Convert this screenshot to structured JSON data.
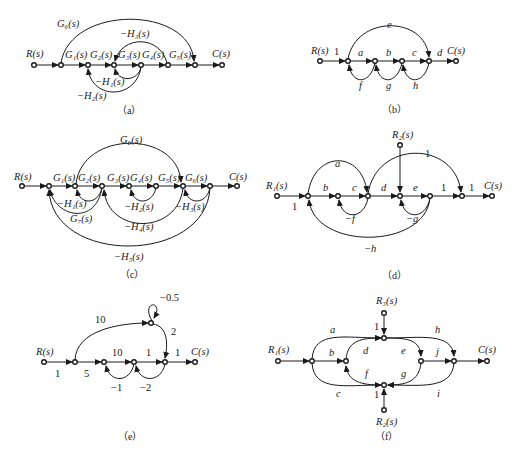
{
  "diagrams": [
    {
      "id": "a",
      "caption": "（a）",
      "input": "R(s)",
      "output": "C(s)",
      "branches": [
        "G1(s)",
        "G2(s)",
        "G3(s)",
        "G4(s)",
        "G5(s)"
      ],
      "feedforward": "G6(s)",
      "loops": [
        "−H1(s)",
        "−H2(s)",
        "−H3(s)"
      ],
      "labels": {
        "R": "R(s)",
        "C": "C(s)",
        "G1": "G₁(s)",
        "G2": "G₂(s)",
        "G3": "G₃(s)",
        "G4": "G₄(s)",
        "G5": "G₅(s)",
        "G6": "G₆(s)",
        "H1": "−H₁(s)",
        "H2": "−H₂(s)",
        "H3": "−H₃(s)"
      }
    },
    {
      "id": "b",
      "caption": "（b）",
      "labels": {
        "R": "R(s)",
        "C": "C(s)",
        "one": "1",
        "a": "a",
        "b": "b",
        "c": "c",
        "d": "d",
        "e": "e",
        "f": "f",
        "g": "g",
        "h": "h"
      }
    },
    {
      "id": "c",
      "caption": "（c）",
      "labels": {
        "R": "R(s)",
        "C": "C(s)",
        "G1": "G₁(s)",
        "G2": "G₂(s)",
        "G3": "G₃(s)",
        "G4": "G₄(s)",
        "G5": "G₅(s)",
        "G6": "G₆(s)",
        "G7": "G₇(s)",
        "G8": "G₈(s)",
        "H1": "−H₁(s)",
        "H2": "−H₂(s)",
        "H3": "−H₃(s)",
        "H4": "−H₄(s)",
        "H5": "−H₅(s)"
      }
    },
    {
      "id": "d",
      "caption": "（d）",
      "labels": {
        "R1": "R₁(s)",
        "R2": "R₂(s)",
        "C": "C(s)",
        "one_in": "1",
        "one_top": "1",
        "one_mid": "1",
        "one_out": "1",
        "a": "a",
        "b": "b",
        "c": "c",
        "d": "d",
        "e": "e",
        "f": "−f",
        "g": "−g",
        "h": "−h"
      }
    },
    {
      "id": "e",
      "caption": "（e）",
      "labels": {
        "R": "R(s)",
        "C": "C(s)",
        "in": "1",
        "five": "5",
        "ten_top": "10",
        "self": "−0.5",
        "two": "2",
        "ten": "10",
        "one_mid": "1",
        "one_out": "1",
        "m1": "−1",
        "m2": "−2"
      }
    },
    {
      "id": "f",
      "caption": "（f）",
      "labels": {
        "R1": "R₁(s)",
        "R2": "R₂(s)",
        "R3": "R₃(s)",
        "C": "C(s)",
        "one_top": "1",
        "one_bot": "1",
        "a": "a",
        "b": "b",
        "c": "c",
        "d": "d",
        "e": "e",
        "f": "f",
        "g": "g",
        "h": "h",
        "i": "i",
        "j": "j"
      }
    }
  ]
}
